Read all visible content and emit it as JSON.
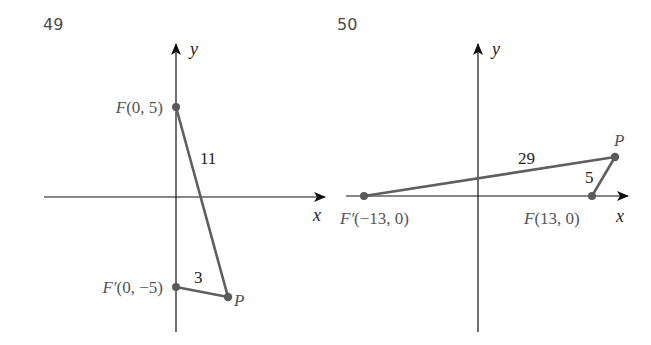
{
  "problems": [
    {
      "number": "49",
      "axes": {
        "x_label": "x",
        "y_label": "y"
      },
      "points": [
        {
          "name": "F",
          "label": "F(0, 5)",
          "coords": [
            0,
            5
          ]
        },
        {
          "name": "F'",
          "label": "F′(0, −5)",
          "coords": [
            0,
            -5
          ]
        },
        {
          "name": "P",
          "label": "P"
        }
      ],
      "segments": [
        {
          "from": "F",
          "to": "P",
          "length_label": "11"
        },
        {
          "from": "F'",
          "to": "P",
          "length_label": "3"
        }
      ]
    },
    {
      "number": "50",
      "axes": {
        "x_label": "x",
        "y_label": "y"
      },
      "points": [
        {
          "name": "F'",
          "label": "F′(−13, 0)",
          "coords": [
            -13,
            0
          ]
        },
        {
          "name": "F",
          "label": "F(13, 0)",
          "coords": [
            13,
            0
          ]
        },
        {
          "name": "P",
          "label": "P"
        }
      ],
      "segments": [
        {
          "from": "F'",
          "to": "P",
          "length_label": "29"
        },
        {
          "from": "F",
          "to": "P",
          "length_label": "5"
        }
      ]
    }
  ],
  "colors": {
    "axis": "#111111",
    "segment": "#5f5f5f",
    "point": "#5a5a5a",
    "label": "#555555"
  }
}
